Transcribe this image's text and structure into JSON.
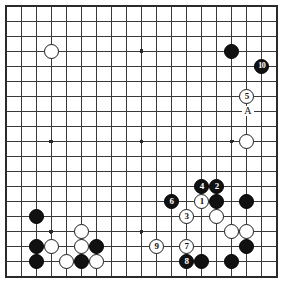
{
  "diagram": {
    "kind": "go-board-diagram",
    "board_size": 19,
    "geometry": {
      "origin_x": 6,
      "origin_y": 6,
      "spacing": 15.05,
      "stone_radius": 7.6,
      "visible_cols": 19,
      "visible_rows": 19
    },
    "colors": {
      "background": "#ffffff",
      "line": "#3a3a3a",
      "border": "#2a2a2a",
      "black_stone": "#111111",
      "white_stone": "#ffffff",
      "white_stone_edge": "#1a1a1a",
      "black_label": "#ffffff",
      "white_label": "#111111"
    },
    "star_points": [
      {
        "col": 4,
        "row": 4
      },
      {
        "col": 10,
        "row": 4
      },
      {
        "col": 16,
        "row": 4
      },
      {
        "col": 4,
        "row": 10
      },
      {
        "col": 10,
        "row": 10
      },
      {
        "col": 16,
        "row": 10
      },
      {
        "col": 4,
        "row": 16
      },
      {
        "col": 10,
        "row": 16
      },
      {
        "col": 16,
        "row": 16
      }
    ],
    "stones": [
      {
        "col": 4,
        "row": 4,
        "color": "white",
        "label": ""
      },
      {
        "col": 16,
        "row": 4,
        "color": "black",
        "label": ""
      },
      {
        "col": 18,
        "row": 5,
        "color": "black",
        "label": "10"
      },
      {
        "col": 17,
        "row": 7,
        "color": "white",
        "label": "5"
      },
      {
        "col": 17,
        "row": 10,
        "color": "white",
        "label": ""
      },
      {
        "col": 14,
        "row": 13,
        "color": "black",
        "label": "4"
      },
      {
        "col": 15,
        "row": 13,
        "color": "black",
        "label": "2"
      },
      {
        "col": 12,
        "row": 14,
        "color": "black",
        "label": "6"
      },
      {
        "col": 14,
        "row": 14,
        "color": "white",
        "label": "1"
      },
      {
        "col": 15,
        "row": 14,
        "color": "black",
        "label": ""
      },
      {
        "col": 17,
        "row": 14,
        "color": "black",
        "label": ""
      },
      {
        "col": 13,
        "row": 15,
        "color": "white",
        "label": "3"
      },
      {
        "col": 15,
        "row": 15,
        "color": "white",
        "label": ""
      },
      {
        "col": 3,
        "row": 15,
        "color": "black",
        "label": ""
      },
      {
        "col": 16,
        "row": 16,
        "color": "white",
        "label": ""
      },
      {
        "col": 17,
        "row": 16,
        "color": "white",
        "label": ""
      },
      {
        "col": 6,
        "row": 16,
        "color": "white",
        "label": ""
      },
      {
        "col": 3,
        "row": 17,
        "color": "black",
        "label": ""
      },
      {
        "col": 4,
        "row": 17,
        "color": "white",
        "label": ""
      },
      {
        "col": 6,
        "row": 17,
        "color": "white",
        "label": ""
      },
      {
        "col": 7,
        "row": 17,
        "color": "black",
        "label": ""
      },
      {
        "col": 11,
        "row": 17,
        "color": "white",
        "label": "9"
      },
      {
        "col": 13,
        "row": 17,
        "color": "white",
        "label": "7"
      },
      {
        "col": 17,
        "row": 17,
        "color": "black",
        "label": ""
      },
      {
        "col": 3,
        "row": 18,
        "color": "black",
        "label": ""
      },
      {
        "col": 5,
        "row": 18,
        "color": "white",
        "label": ""
      },
      {
        "col": 6,
        "row": 18,
        "color": "black",
        "label": ""
      },
      {
        "col": 7,
        "row": 18,
        "color": "white",
        "label": ""
      },
      {
        "col": 13,
        "row": 18,
        "color": "black",
        "label": "8"
      },
      {
        "col": 14,
        "row": 18,
        "color": "black",
        "label": ""
      },
      {
        "col": 16,
        "row": 18,
        "color": "black",
        "label": ""
      }
    ],
    "letter_markers": [
      {
        "col": 17,
        "row": 8,
        "text": "A"
      }
    ],
    "move_sequence": [
      {
        "number": "1",
        "color": "white"
      },
      {
        "number": "2",
        "color": "black"
      },
      {
        "number": "3",
        "color": "white"
      },
      {
        "number": "4",
        "color": "black"
      },
      {
        "number": "5",
        "color": "white"
      },
      {
        "number": "6",
        "color": "black"
      },
      {
        "number": "7",
        "color": "white"
      },
      {
        "number": "8",
        "color": "black"
      },
      {
        "number": "9",
        "color": "white"
      },
      {
        "number": "10",
        "color": "black"
      }
    ]
  }
}
